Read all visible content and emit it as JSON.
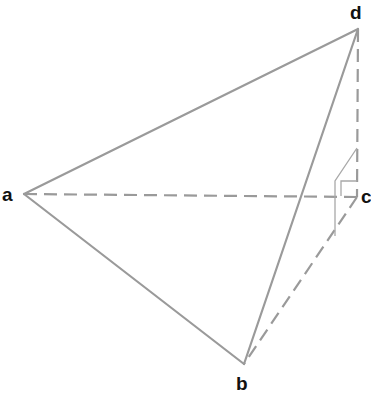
{
  "diagram": {
    "vertices": [
      {
        "id": "a",
        "label": "a"
      },
      {
        "id": "b",
        "label": "b"
      },
      {
        "id": "c",
        "label": "c"
      },
      {
        "id": "d",
        "label": "d"
      }
    ],
    "edges": [
      {
        "from": "a",
        "to": "d",
        "style": "solid"
      },
      {
        "from": "a",
        "to": "b",
        "style": "solid"
      },
      {
        "from": "b",
        "to": "d",
        "style": "solid"
      },
      {
        "from": "a",
        "to": "c",
        "style": "dashed"
      },
      {
        "from": "c",
        "to": "b",
        "style": "dashed"
      },
      {
        "from": "d",
        "to": "c",
        "style": "dashed"
      }
    ],
    "annotations": [
      {
        "type": "right-angle",
        "at": "c",
        "between": [
          "d",
          "a"
        ]
      },
      {
        "type": "perpendicular-plane-marker",
        "at": "c",
        "plane": [
          "d",
          "c",
          "b"
        ]
      }
    ],
    "colors": {
      "edge": "#9a9a9a",
      "label": "#111111",
      "background": "#ffffff"
    }
  }
}
